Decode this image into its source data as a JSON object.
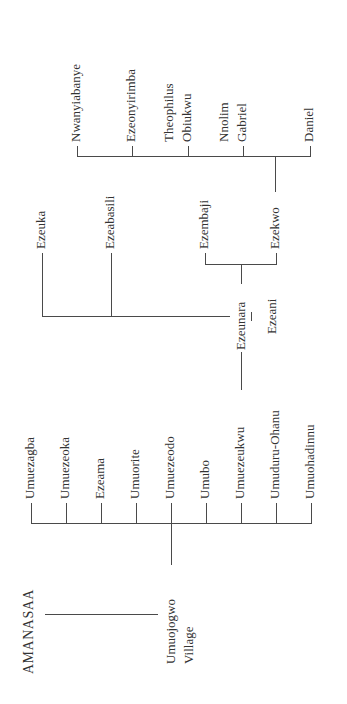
{
  "diagram": {
    "type": "family-tree",
    "orientation": "rotated -90deg",
    "root": "AMANASAA",
    "village": {
      "line1": "Umuojogwo",
      "line2": "Village"
    },
    "kindreds": [
      "Umuezagba",
      "Umuezeoka",
      "Ezeama",
      "Umuorite",
      "Umuezeodo",
      "Umubo",
      "Umuezeukwu",
      "Umuduru-Ohanu",
      "Umuohadinnu"
    ],
    "ancestors": {
      "couple": {
        "husband": "Ezeunara",
        "separator": "|",
        "wife": "Ezeani"
      },
      "siblings": [
        "Ezeuka",
        "Ezeabasili"
      ]
    },
    "sons": [
      "Ezembaji",
      "Ezekwo"
    ],
    "grandchildren": [
      {
        "line1": "Nwanyiabanye"
      },
      {
        "line1": "Ezeonyirimba"
      },
      {
        "line1": "Theophilus",
        "line2": "Obiukwu"
      },
      {
        "line1": "Nnolim",
        "line2": "Gabriel"
      },
      {
        "line1": "Daniel"
      }
    ],
    "colors": {
      "line": "#4a4a4a",
      "text": "#333333",
      "background": "#ffffff"
    }
  }
}
